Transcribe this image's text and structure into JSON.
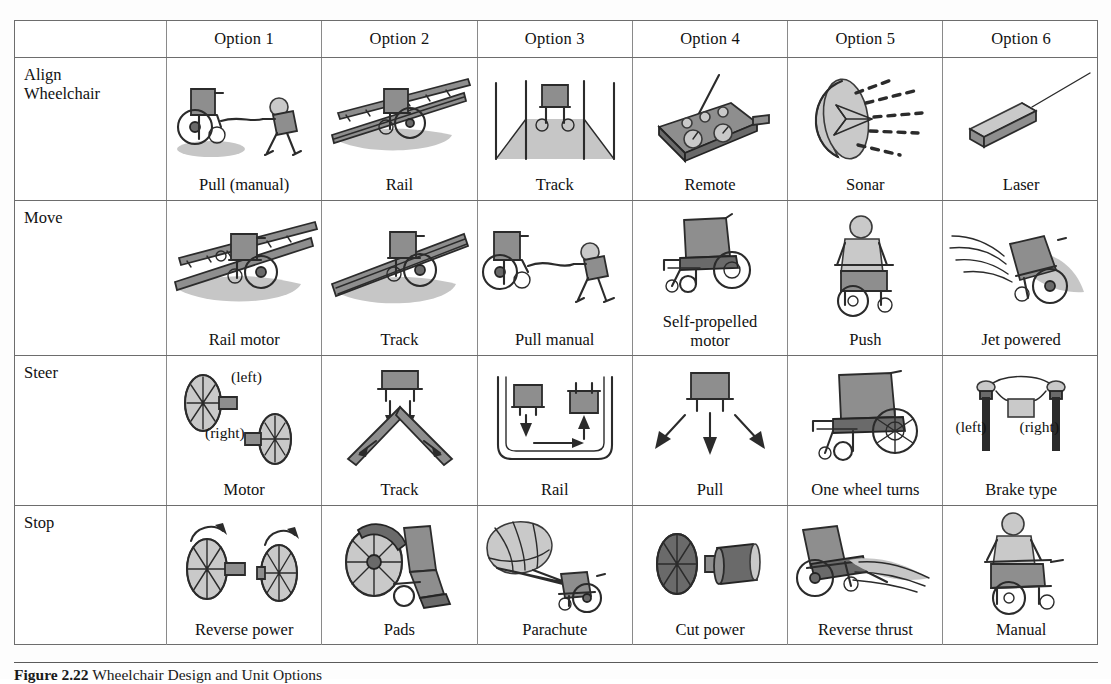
{
  "figure": {
    "caption_number": "Figure 2.22",
    "caption_text": "Wheelchair Design and Unit Options"
  },
  "table": {
    "corner_label": "",
    "column_headers": [
      "Option 1",
      "Option 2",
      "Option 3",
      "Option 4",
      "Option 5",
      "Option 6"
    ],
    "rows": [
      {
        "label": "Align\nWheelchair",
        "label_line1": "Align",
        "label_line2": "Wheelchair",
        "cells": [
          {
            "caption": "Pull (manual)",
            "icon": "wheelchair-pulled-by-person-icon",
            "annotations": []
          },
          {
            "caption": "Rail",
            "icon": "wheelchair-on-rail-icon",
            "annotations": []
          },
          {
            "caption": "Track",
            "icon": "wheelchair-on-floor-track-icon",
            "annotations": []
          },
          {
            "caption": "Remote",
            "icon": "remote-control-icon",
            "annotations": []
          },
          {
            "caption": "Sonar",
            "icon": "sonar-dish-icon",
            "annotations": []
          },
          {
            "caption": "Laser",
            "icon": "laser-pointer-icon",
            "annotations": []
          }
        ]
      },
      {
        "label": "Move",
        "label_line1": "Move",
        "label_line2": "",
        "cells": [
          {
            "caption": "Rail motor",
            "icon": "wheelchair-on-rail-motor-icon",
            "annotations": []
          },
          {
            "caption": "Track",
            "icon": "wheelchair-on-track-icon",
            "annotations": []
          },
          {
            "caption": "Pull manual",
            "icon": "wheelchair-pulled-by-person-icon",
            "annotations": []
          },
          {
            "caption": "Self-propelled motor",
            "caption_line1": "Self-propelled",
            "caption_line2": "motor",
            "icon": "motorized-wheelchair-icon",
            "annotations": []
          },
          {
            "caption": "Push",
            "icon": "person-pushing-wheelchair-icon",
            "annotations": []
          },
          {
            "caption": "Jet powered",
            "icon": "jet-powered-wheelchair-icon",
            "annotations": []
          }
        ]
      },
      {
        "label": "Steer",
        "label_line1": "Steer",
        "label_line2": "",
        "cells": [
          {
            "caption": "Motor",
            "icon": "two-motor-wheels-icon",
            "annotations": [
              "(left)",
              "(right)"
            ]
          },
          {
            "caption": "Track",
            "icon": "v-track-steering-icon",
            "annotations": []
          },
          {
            "caption": "Rail",
            "icon": "u-rail-loop-icon",
            "annotations": []
          },
          {
            "caption": "Pull",
            "icon": "pull-direction-arrows-icon",
            "annotations": []
          },
          {
            "caption": "One wheel turns",
            "icon": "wheelchair-side-view-icon",
            "annotations": []
          },
          {
            "caption": "Brake type",
            "icon": "dual-brake-lever-icon",
            "annotations": [
              "(left)",
              "(right)"
            ]
          }
        ]
      },
      {
        "label": "Stop",
        "label_line1": "Stop",
        "label_line2": "",
        "cells": [
          {
            "caption": "Reverse power",
            "icon": "reverse-rotating-wheels-icon",
            "annotations": []
          },
          {
            "caption": "Pads",
            "icon": "brake-pads-wheelchair-icon",
            "annotations": []
          },
          {
            "caption": "Parachute",
            "icon": "parachute-wheelchair-icon",
            "annotations": []
          },
          {
            "caption": "Cut power",
            "icon": "wheel-motor-disconnect-icon",
            "annotations": []
          },
          {
            "caption": "Reverse thrust",
            "icon": "reverse-thrust-wheelchair-icon",
            "annotations": []
          },
          {
            "caption": "Manual",
            "icon": "manual-braking-person-icon",
            "annotations": []
          }
        ]
      }
    ]
  },
  "colors": {
    "page_background": "#fdfdfd",
    "table_border": "#6d6d6d",
    "cell_divider": "#8a8a8a",
    "ink": "#2b2b2b",
    "shadow_gray": "#c6c6c6",
    "midtone_gray": "#8e8e8e"
  }
}
